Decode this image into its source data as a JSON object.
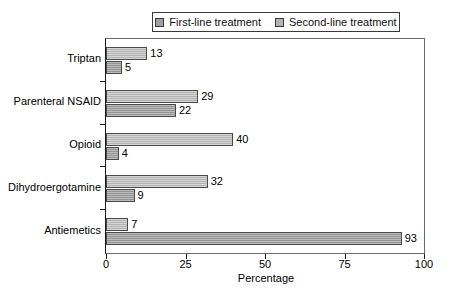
{
  "chart_data": {
    "type": "bar",
    "orientation": "horizontal",
    "title": "",
    "xlabel": "Percentage",
    "ylabel": "",
    "xlim": [
      0,
      100
    ],
    "xticks": [
      0,
      25,
      50,
      75,
      100
    ],
    "grid": false,
    "legend_position": "top",
    "categories": [
      "Triptan",
      "Parenteral NSAID",
      "Opioid",
      "Dihydroergotamine",
      "Antiemetics"
    ],
    "series": [
      {
        "name": "Second-line treatment",
        "color": "#b3b3b3",
        "values": [
          13,
          29,
          40,
          32,
          7
        ]
      },
      {
        "name": "First-line treatment",
        "color": "#a0a0a0",
        "values": [
          5,
          22,
          4,
          9,
          93
        ]
      }
    ]
  },
  "legend": {
    "entries": [
      {
        "label": "First-line treatment",
        "swatch": "#a0a0a0"
      },
      {
        "label": "Second-line treatment",
        "swatch": "#b3b3b3"
      }
    ]
  }
}
